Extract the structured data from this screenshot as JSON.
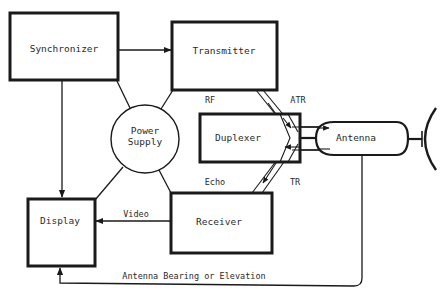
{
  "diagram": {
    "blocks": {
      "synchronizer": {
        "label": "Synchronizer"
      },
      "transmitter": {
        "label": "Transmitter"
      },
      "power_supply": {
        "label_line1": "Power",
        "label_line2": "Supply"
      },
      "duplexer": {
        "label": "Duplexer"
      },
      "antenna": {
        "label": "Antenna"
      },
      "display": {
        "label": "Display"
      },
      "receiver": {
        "label": "Receiver"
      }
    },
    "signal_labels": {
      "rf": "RF",
      "atr": "ATR",
      "echo": "Echo",
      "tr": "TR",
      "video": "Video",
      "antenna_bearing": "Antenna Bearing or Elevation"
    },
    "colors": {
      "stroke": "#1a1a1a",
      "text": "#2a2a2a",
      "background": "#ffffff"
    }
  }
}
